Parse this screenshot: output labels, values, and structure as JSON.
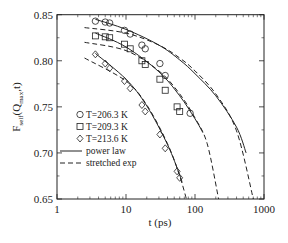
{
  "chart_data": {
    "type": "scatter",
    "title": "",
    "xlabel": "t  (ps)",
    "ylabel": "F_self(Q_max,t)",
    "xscale": "log",
    "xlim": [
      1,
      1000
    ],
    "ylim": [
      0.65,
      0.85
    ],
    "xticks": [
      1,
      10,
      100,
      1000
    ],
    "xtick_labels": [
      "1",
      "10",
      "100",
      "1000"
    ],
    "yticks": [
      0.65,
      0.7,
      0.75,
      0.8,
      0.85
    ],
    "ytick_labels": [
      "0.65",
      "0.70",
      "0.75",
      "0.80",
      "0.85"
    ],
    "grid": false,
    "legend_position": "lower left",
    "series": [
      {
        "name": "T=206.3 K",
        "marker": "circle",
        "x": [
          3.6,
          5.0,
          5.8,
          9.5,
          11.5,
          17,
          19,
          31,
          37,
          85
        ],
        "y": [
          0.843,
          0.842,
          0.841,
          0.833,
          0.829,
          0.817,
          0.813,
          0.797,
          0.784,
          0.743
        ],
        "power_law_fit": {
          "x": [
            3.6,
            10,
            30,
            60,
            100,
            200,
            400,
            550
          ],
          "y": [
            0.845,
            0.834,
            0.817,
            0.801,
            0.786,
            0.762,
            0.728,
            0.7
          ]
        },
        "stretched_exp_fit": {
          "x": [
            2.5,
            10,
            30,
            60,
            100,
            200,
            400,
            700
          ],
          "y": [
            0.836,
            0.83,
            0.817,
            0.803,
            0.789,
            0.764,
            0.724,
            0.65
          ]
        }
      },
      {
        "name": "T=209.3 K",
        "marker": "square",
        "x": [
          3.6,
          5.0,
          5.8,
          9.5,
          11.5,
          17,
          19,
          31,
          37,
          55,
          60
        ],
        "y": [
          0.827,
          0.826,
          0.825,
          0.818,
          0.813,
          0.8,
          0.796,
          0.78,
          0.768,
          0.75,
          0.745
        ],
        "power_law_fit": {
          "x": [
            3.6,
            10,
            30,
            60,
            100,
            130
          ],
          "y": [
            0.83,
            0.815,
            0.788,
            0.762,
            0.737,
            0.722
          ]
        },
        "stretched_exp_fit": {
          "x": [
            2.5,
            10,
            30,
            60,
            100,
            150,
            220
          ],
          "y": [
            0.82,
            0.811,
            0.789,
            0.764,
            0.738,
            0.71,
            0.65
          ]
        }
      },
      {
        "name": "T=213.6 K",
        "marker": "diamond",
        "x": [
          3.6,
          5.0,
          5.8,
          9.5,
          11.5,
          17,
          19,
          31,
          37,
          55,
          60
        ],
        "y": [
          0.807,
          0.797,
          0.792,
          0.778,
          0.77,
          0.752,
          0.745,
          0.72,
          0.705,
          0.68,
          0.673
        ],
        "power_law_fit": {
          "x": [
            3.6,
            10,
            20,
            40,
            60,
            65
          ],
          "y": [
            0.808,
            0.78,
            0.751,
            0.709,
            0.676,
            0.668
          ]
        },
        "stretched_exp_fit": {
          "x": [
            2.5,
            10,
            20,
            40,
            60,
            75
          ],
          "y": [
            0.803,
            0.778,
            0.752,
            0.71,
            0.675,
            0.65
          ]
        }
      }
    ],
    "legend": [
      {
        "label": "T=206.3 K",
        "symbol": "circle"
      },
      {
        "label": "T=209.3 K",
        "symbol": "square"
      },
      {
        "label": "T=213.6 K",
        "symbol": "diamond"
      },
      {
        "label": "power law",
        "symbol": "solid-line"
      },
      {
        "label": "stretched exp",
        "symbol": "dashed-line"
      }
    ]
  },
  "axes": {
    "xlabel": "t  (ps)",
    "ylabel_main": "F",
    "ylabel_sub": "self",
    "ylabel_rest": "(Q",
    "ylabel_sub2": "max",
    "ylabel_end": ",t)"
  },
  "colors": {
    "ink": "#222222",
    "background": "#ffffff"
  }
}
